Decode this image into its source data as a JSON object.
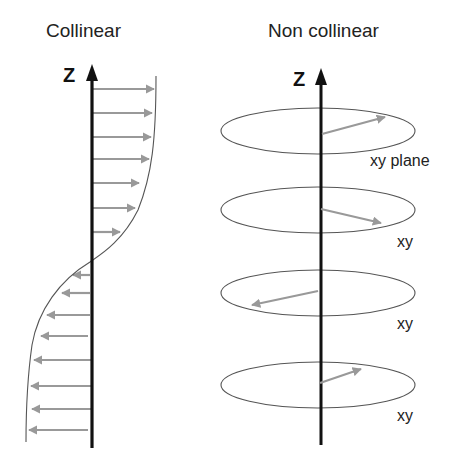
{
  "panels": {
    "collinear": {
      "title": "Collinear",
      "axis_label": "Z",
      "axis_x": 92,
      "axis_top": 64,
      "axis_bottom": 448,
      "right_arrows": [
        {
          "y": 89,
          "tip": 154
        },
        {
          "y": 113,
          "tip": 152
        },
        {
          "y": 137,
          "tip": 151
        },
        {
          "y": 159,
          "tip": 149
        },
        {
          "y": 183,
          "tip": 139
        },
        {
          "y": 208,
          "tip": 135
        },
        {
          "y": 232,
          "tip": 120
        }
      ],
      "left_arrows": [
        {
          "y": 275,
          "tip": 73,
          "start": 90
        },
        {
          "y": 293,
          "tip": 62,
          "start": 90
        },
        {
          "y": 315,
          "tip": 47,
          "start": 90
        },
        {
          "y": 336,
          "tip": 41,
          "start": 88
        },
        {
          "y": 360,
          "tip": 34,
          "start": 91
        },
        {
          "y": 386,
          "tip": 31,
          "start": 91
        },
        {
          "y": 409,
          "tip": 32,
          "start": 91
        },
        {
          "y": 430,
          "tip": 29,
          "start": 88
        }
      ]
    },
    "non_collinear": {
      "title": "Non collinear",
      "axis_label": "Z",
      "axis_x": 321,
      "axis_top": 68,
      "axis_bottom": 445,
      "planes": [
        {
          "label": "xy plane",
          "cy": 131,
          "label_x": 370,
          "label_y": 166,
          "arrow": {
            "x1": 322,
            "y1": 134,
            "x2": 385,
            "y2": 117
          }
        },
        {
          "label": "xy",
          "cy": 210,
          "label_x": 397,
          "label_y": 247,
          "arrow": {
            "x1": 321,
            "y1": 209,
            "x2": 381,
            "y2": 223
          }
        },
        {
          "label": "xy",
          "cy": 293,
          "label_x": 397,
          "label_y": 329,
          "arrow": {
            "x1": 318,
            "y1": 291,
            "x2": 252,
            "y2": 305
          }
        },
        {
          "label": "xy",
          "cy": 385,
          "label_x": 397,
          "label_y": 421,
          "arrow": {
            "x1": 320,
            "y1": 383,
            "x2": 361,
            "y2": 369
          }
        }
      ],
      "ellipse": {
        "cx": 318,
        "rx": 97,
        "ry": 23
      }
    }
  },
  "colors": {
    "axis": "#111111",
    "arrow": "#999999",
    "curve": "#555555",
    "ellipse": "#555555"
  }
}
